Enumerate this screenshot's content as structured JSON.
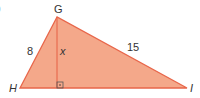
{
  "diagram": {
    "type": "right-triangle-with-altitude",
    "fill_color": "#f4a88a",
    "stroke_color": "#e8664a",
    "label_color": "#333333",
    "vertices": {
      "G": {
        "label": "G",
        "x": 57,
        "y": 17
      },
      "H": {
        "label": "H",
        "x": 20,
        "y": 88
      },
      "I": {
        "label": "I",
        "x": 187,
        "y": 88
      }
    },
    "altitude_foot": {
      "x": 57,
      "y": 88
    },
    "side_labels": {
      "GH": "8",
      "GI": "15",
      "altitude": "x"
    },
    "right_angle_marker": "right-angle-with-dot",
    "corner_fragment": ")"
  }
}
